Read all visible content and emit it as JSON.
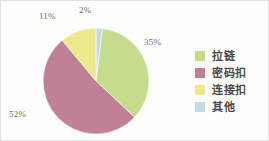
{
  "chart_data": {
    "type": "pie",
    "title": "",
    "subtitle": "",
    "xlabel": "",
    "ylabel": "",
    "legend_position": "right",
    "grid": false,
    "start_angle_deg": 0,
    "direction": "clockwise",
    "unit": "%",
    "categories": [
      "拉链",
      "密码扣",
      "连接扣",
      "其他"
    ],
    "values": [
      35,
      52,
      11,
      2
    ],
    "value_labels": [
      "35%",
      "52%",
      "11%",
      "2%"
    ],
    "colors": [
      "#c3dd8c",
      "#c08098",
      "#ece98a",
      "#c5dbe3"
    ],
    "slices": [
      {
        "label": "拉链",
        "value": 35,
        "value_label": "35%",
        "color": "#c3dd8c"
      },
      {
        "label": "密码扣",
        "value": 52,
        "value_label": "52%",
        "color": "#c08098"
      },
      {
        "label": "连接扣",
        "value": 11,
        "value_label": "11%",
        "color": "#ece98a"
      },
      {
        "label": "其他",
        "value": 2,
        "value_label": "2%",
        "color": "#c5dbe3"
      }
    ]
  },
  "pie": {
    "labels": {
      "zipper_pct": "35%",
      "lock_pct": "52%",
      "connector_pct": "11%",
      "other_pct": "2%"
    }
  },
  "legend": {
    "items": [
      {
        "label": "拉链",
        "color": "#c3dd8c"
      },
      {
        "label": "密码扣",
        "color": "#c08098"
      },
      {
        "label": "连接扣",
        "color": "#ece98a"
      },
      {
        "label": "其他",
        "color": "#c5dbe3"
      }
    ]
  }
}
